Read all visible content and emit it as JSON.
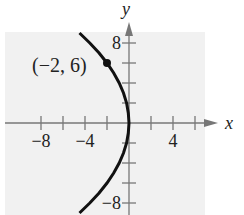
{
  "chart_data": {
    "type": "line",
    "title": "",
    "xlabel": "x",
    "ylabel": "y",
    "xlim": [
      -9,
      7
    ],
    "ylim": [
      -9,
      9
    ],
    "x_tick_step": 2,
    "y_tick_step": 2,
    "x_tick_labels": [
      {
        "value": -8,
        "text": "−8"
      },
      {
        "value": -4,
        "text": "−4"
      },
      {
        "value": 4,
        "text": "4"
      }
    ],
    "y_tick_labels": [
      {
        "value": 8,
        "text": "8"
      },
      {
        "value": -8,
        "text": "−8"
      }
    ],
    "grid": false,
    "background_color": "#f1f1f1",
    "curve_color": "#111111",
    "axis_color": "#777777",
    "series": [
      {
        "name": "parabola",
        "equation": "x = -y^2/18",
        "points": [
          [
            -4.5,
            9
          ],
          [
            -3.56,
            8
          ],
          [
            -2.72,
            7
          ],
          [
            -2,
            6
          ],
          [
            -1.39,
            5
          ],
          [
            -0.89,
            4
          ],
          [
            -0.5,
            3
          ],
          [
            -0.22,
            2
          ],
          [
            -0.06,
            1
          ],
          [
            0,
            0
          ],
          [
            -0.06,
            -1
          ],
          [
            -0.22,
            -2
          ],
          [
            -0.5,
            -3
          ],
          [
            -0.89,
            -4
          ],
          [
            -1.39,
            -5
          ],
          [
            -2,
            -6
          ],
          [
            -2.72,
            -7
          ],
          [
            -3.56,
            -8
          ],
          [
            -4.5,
            -9
          ]
        ]
      }
    ],
    "annotations": [
      {
        "point": [
          -2,
          6
        ],
        "label": "(−2, 6)",
        "marker": "filled-circle"
      }
    ]
  }
}
